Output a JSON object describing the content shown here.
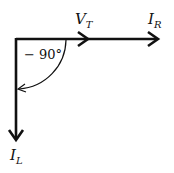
{
  "diagram": {
    "type": "phasor-diagram",
    "background": "#ffffff",
    "stroke_color": "#111111",
    "origin": {
      "x": 16,
      "y": 39
    },
    "phasors": [
      {
        "name": "V_T",
        "label_main": "V",
        "label_sub": "T",
        "direction": "right",
        "tip": {
          "x": 88,
          "y": 39
        }
      },
      {
        "name": "I_R",
        "label_main": "I",
        "label_sub": "R",
        "direction": "right",
        "tip": {
          "x": 158,
          "y": 39
        }
      },
      {
        "name": "I_L",
        "label_main": "I",
        "label_sub": "L",
        "direction": "down",
        "tip": {
          "x": 16,
          "y": 140
        }
      }
    ],
    "angle_arc": {
      "label": "− 90°",
      "from": "V_T",
      "to": "I_L",
      "radius": 50
    }
  }
}
